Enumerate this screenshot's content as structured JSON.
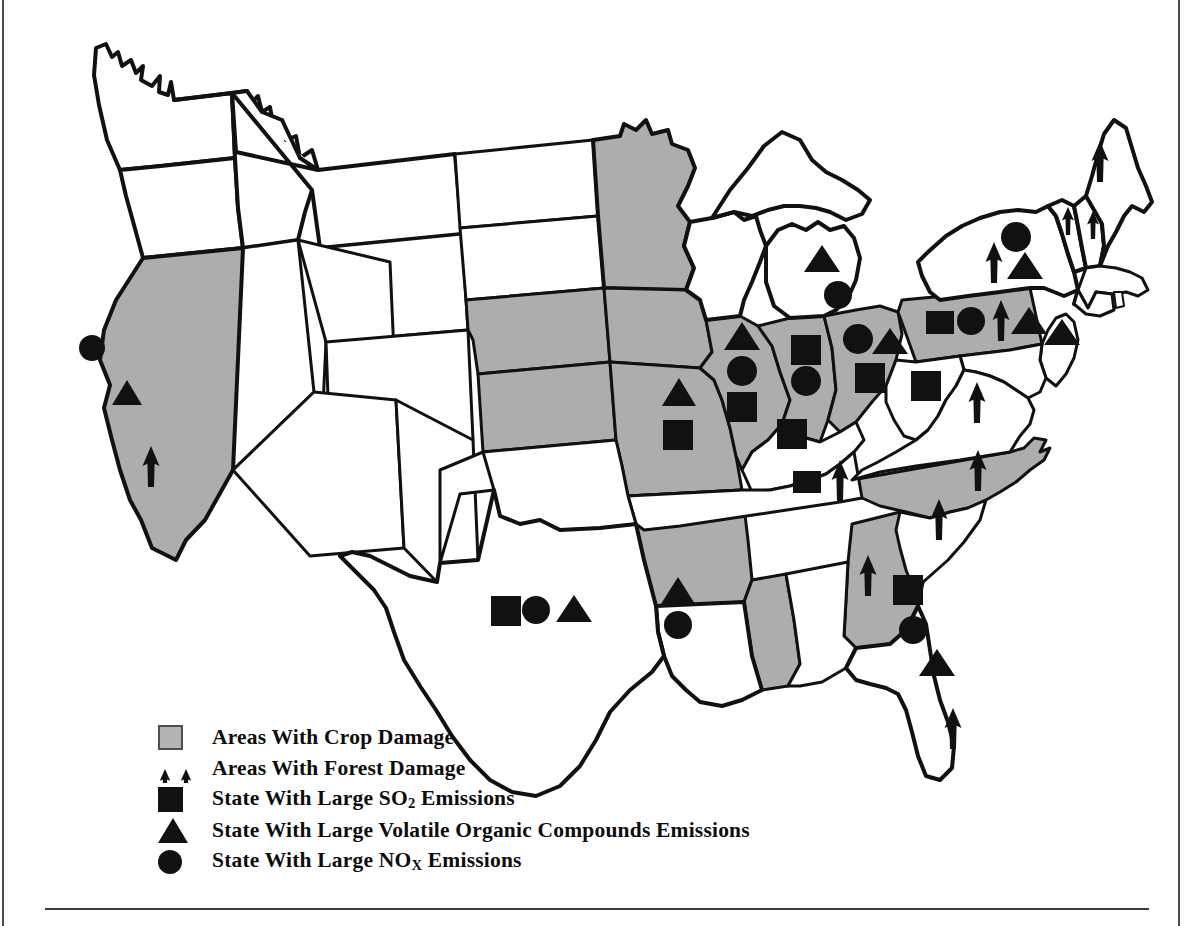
{
  "figure": {
    "kind": "thematic-map",
    "region": "Contiguous United States",
    "colors": {
      "crop_damage_fill": "#adadad",
      "no_damage_fill": "#ffffff",
      "outline": "#111111",
      "marker": "#111111",
      "frame_rule": "#3c3c3c"
    }
  },
  "legend": {
    "items": [
      {
        "symbol": "crop-damage-swatch",
        "label": "Areas With Crop Damage"
      },
      {
        "symbol": "forest-damage-arrows",
        "label": "Areas With Forest Damage"
      },
      {
        "symbol": "so2-square",
        "label_pre": "State With Large SO",
        "label_sub": "2",
        "label_post": " Emissions"
      },
      {
        "symbol": "voc-triangle",
        "label": "State With Large Volatile Organic Compounds Emissions"
      },
      {
        "symbol": "nox-circle",
        "label_pre": "State With Large NO",
        "label_sub": "X",
        "label_post": " Emissions"
      }
    ]
  },
  "map_data": {
    "shaded_states_crop_damage": [
      "California",
      "Minnesota",
      "Nebraska",
      "Kansas",
      "Iowa",
      "Missouri",
      "Illinois",
      "Indiana",
      "Ohio",
      "Arkansas",
      "Mississippi",
      "Georgia",
      "North Carolina",
      "Pennsylvania"
    ],
    "markers": [
      {
        "state": "California",
        "symbols": [
          "circle",
          "triangle",
          "arrow"
        ]
      },
      {
        "state": "Minnesota",
        "symbols": []
      },
      {
        "state": "Iowa",
        "symbols": [
          "triangle"
        ]
      },
      {
        "state": "Missouri",
        "symbols": [
          "triangle",
          "square"
        ]
      },
      {
        "state": "Illinois",
        "symbols": [
          "triangle",
          "circle",
          "square"
        ]
      },
      {
        "state": "Indiana",
        "symbols": [
          "square",
          "circle"
        ]
      },
      {
        "state": "Ohio",
        "symbols": [
          "circle",
          "triangle",
          "square"
        ]
      },
      {
        "state": "Michigan",
        "symbols": [
          "triangle",
          "circle"
        ]
      },
      {
        "state": "Kentucky",
        "symbols": [
          "square"
        ]
      },
      {
        "state": "Tennessee",
        "symbols": [
          "square",
          "arrow"
        ]
      },
      {
        "state": "West Virginia",
        "symbols": [
          "square"
        ]
      },
      {
        "state": "Virginia",
        "symbols": [
          "arrow"
        ]
      },
      {
        "state": "North Carolina",
        "symbols": [
          "arrow"
        ]
      },
      {
        "state": "South Carolina",
        "symbols": [
          "arrow"
        ]
      },
      {
        "state": "Georgia",
        "symbols": [
          "arrow",
          "square"
        ]
      },
      {
        "state": "Florida",
        "symbols": [
          "circle",
          "triangle",
          "arrow"
        ]
      },
      {
        "state": "Alabama",
        "symbols": []
      },
      {
        "state": "Louisiana",
        "symbols": [
          "triangle",
          "circle"
        ]
      },
      {
        "state": "Texas",
        "symbols": [
          "square",
          "circle",
          "triangle"
        ]
      },
      {
        "state": "Pennsylvania",
        "symbols": [
          "square",
          "circle",
          "arrow",
          "triangle"
        ]
      },
      {
        "state": "New York",
        "symbols": [
          "circle",
          "arrow",
          "triangle"
        ]
      },
      {
        "state": "New Jersey",
        "symbols": [
          "triangle"
        ]
      },
      {
        "state": "Vermont",
        "symbols": [
          "arrow"
        ]
      },
      {
        "state": "New Hampshire",
        "symbols": [
          "arrow"
        ]
      },
      {
        "state": "Maine",
        "symbols": [
          "arrow"
        ]
      }
    ],
    "marker_counts": {
      "square": 12,
      "triangle": 13,
      "circle": 11,
      "arrow": 13
    }
  }
}
